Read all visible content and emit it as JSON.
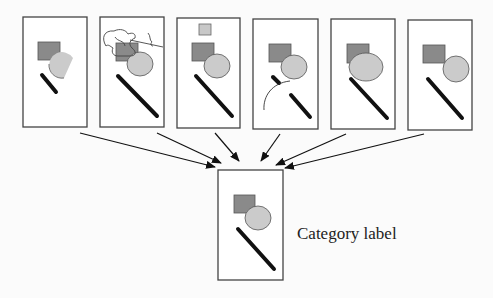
{
  "diagram": {
    "type": "many-to-one aggregation",
    "input_panels": [
      {
        "id": 1,
        "variant": "partial-occlusion",
        "shapes": [
          "square",
          "partial-circle",
          "short-bar"
        ]
      },
      {
        "id": 2,
        "variant": "scribble-clutter",
        "shapes": [
          "square",
          "circle",
          "bar",
          "scribble"
        ]
      },
      {
        "id": 3,
        "variant": "extra-small-square",
        "shapes": [
          "small-square",
          "square",
          "circle",
          "bar"
        ]
      },
      {
        "id": 4,
        "variant": "broken-bar-with-arc",
        "shapes": [
          "square",
          "circle",
          "broken-bar",
          "arc"
        ]
      },
      {
        "id": 5,
        "variant": "enlarged-circle",
        "shapes": [
          "square",
          "large-ellipse",
          "bar"
        ]
      },
      {
        "id": 6,
        "variant": "canonical-shifted",
        "shapes": [
          "square",
          "circle",
          "bar"
        ]
      }
    ],
    "output_panel": {
      "shapes": [
        "square",
        "circle",
        "bar"
      ],
      "label": "Category label"
    },
    "colors": {
      "square": "#8a8a8a",
      "circle": "#cbcbcb",
      "bar": "#111111",
      "frame": "#444444",
      "small_square": "#c8c8c8"
    }
  }
}
